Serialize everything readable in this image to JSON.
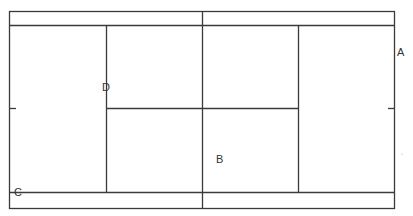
{
  "diagram": {
    "type": "tennis-court",
    "line_color": "#3a3a3a",
    "background": "#ffffff",
    "labels": [
      {
        "id": "A",
        "text": "A",
        "x": 397,
        "y": 47
      },
      {
        "id": "B",
        "text": "B",
        "x": 216,
        "y": 154
      },
      {
        "id": "C",
        "text": "C",
        "x": 14,
        "y": 187
      },
      {
        "id": "D",
        "text": "D",
        "x": 102,
        "y": 82
      }
    ]
  }
}
